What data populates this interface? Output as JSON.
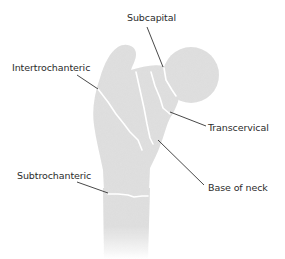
{
  "diagram": {
    "colors": {
      "bone": "#dcdcdc",
      "bone_shadow": "#cfcfcf",
      "fracture_line": "#ffffff",
      "leader_line": "#333333",
      "label_text": "#2b2b2b",
      "background": "#ffffff"
    },
    "labels": [
      {
        "id": "subcapital",
        "text": "Subcapital"
      },
      {
        "id": "intertrochanteric",
        "text": "Intertrochanteric"
      },
      {
        "id": "transcervical",
        "text": "Transcervical"
      },
      {
        "id": "base_of_neck",
        "text": "Base of neck"
      },
      {
        "id": "subtrochanteric",
        "text": "Subtrochanteric"
      }
    ]
  }
}
